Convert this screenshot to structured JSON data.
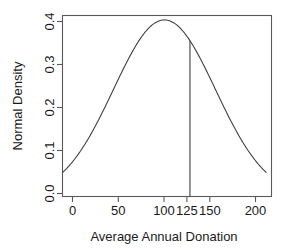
{
  "chart_data": {
    "type": "line",
    "title": "",
    "xlabel": "Average Annual Donation",
    "ylabel": "Normal Density",
    "xlim": [
      0,
      205
    ],
    "ylim": [
      0,
      0.41
    ],
    "grid": false,
    "legend": "none",
    "xticks": [
      0,
      50,
      100,
      125,
      150,
      200
    ],
    "xtick_labels": [
      "0",
      "50",
      "100",
      "125",
      "150",
      "200"
    ],
    "yticks": [
      0.0,
      0.1,
      0.2,
      0.3,
      0.4
    ],
    "ytick_labels": [
      "0.0",
      "0.1",
      "0.2",
      "0.3",
      "0.4"
    ],
    "curve": {
      "name": "Normal Density",
      "distribution": "normal",
      "mean": 100,
      "sd": 50,
      "peak_value": 0.4,
      "x": [
        0,
        10,
        20,
        30,
        40,
        50,
        60,
        70,
        80,
        90,
        100,
        110,
        120,
        125,
        130,
        140,
        150,
        160,
        170,
        180,
        190,
        200
      ],
      "y": [
        0.0541,
        0.0773,
        0.1065,
        0.1416,
        0.1815,
        0.2242,
        0.2668,
        0.3057,
        0.3373,
        0.358,
        0.4,
        0.358,
        0.3373,
        0.3213,
        0.3057,
        0.2668,
        0.2242,
        0.1815,
        0.1416,
        0.1065,
        0.0773,
        0.0541
      ]
    },
    "annotations": [
      {
        "type": "vertical-line",
        "name": "cutoff-line",
        "x": 125,
        "y_top": 0.3213,
        "y_bottom": 0.0
      }
    ]
  },
  "axes": {
    "x_title": "Average Annual Donation",
    "y_title": "Normal Density"
  }
}
